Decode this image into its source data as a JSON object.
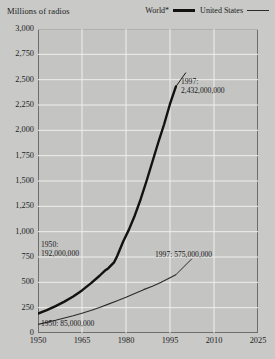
{
  "header": {
    "axis_title": "Millions of radios"
  },
  "legend": {
    "position": "top-right",
    "items": [
      {
        "label": "World*",
        "style": "thick-line",
        "color": "#14120f"
      },
      {
        "label": "United States",
        "style": "thin-line",
        "color": "#2b2b2b"
      }
    ]
  },
  "annotations": [
    {
      "id": "world-1997",
      "line1": "1997:",
      "line2": "2,432,000,000"
    },
    {
      "id": "world-1950",
      "line1": "1950:",
      "line2": "192,000,000"
    },
    {
      "id": "us-1997",
      "text": "1997:  575,000,000"
    },
    {
      "id": "us-1950",
      "text": "1950: 85,000,000"
    }
  ],
  "colors": {
    "background": "#c9c9c7",
    "plot_background": "#c4c4c2",
    "gridline": "#efefed",
    "border": "#6e6e6c",
    "world_line": "#14120f",
    "us_line": "#2b2b2b",
    "text": "#1c1c1c"
  },
  "chart_data": {
    "type": "line",
    "title": "",
    "subtitle": "",
    "xlabel": "",
    "ylabel": "Millions of radios",
    "xlim": [
      1950,
      2025
    ],
    "ylim": [
      0,
      3000
    ],
    "grid": true,
    "legend_position": "top-right",
    "footnote": "* asterisk on World series label",
    "yticks": [
      0,
      250,
      500,
      750,
      1000,
      1250,
      1500,
      1750,
      2000,
      2250,
      2500,
      2750,
      3000
    ],
    "ytick_labels": [
      "0",
      "250",
      "500",
      "750",
      "1,000",
      "1,250",
      "1,500",
      "1,750",
      "2,000",
      "2,250",
      "2,500",
      "2,750",
      "3,000"
    ],
    "xticks": [
      1950,
      1965,
      1980,
      1995,
      2010,
      2025
    ],
    "xtick_labels": [
      "1950",
      "1965",
      "1980",
      "1995",
      "2010",
      "2025"
    ],
    "series": [
      {
        "name": "World*",
        "color": "#14120f",
        "width": "thick",
        "x": [
          1950,
          1953,
          1956,
          1959,
          1962,
          1965,
          1968,
          1971,
          1973,
          1974,
          1976,
          1977,
          1979,
          1981,
          1983,
          1985,
          1987,
          1989,
          1991,
          1993,
          1995,
          1997
        ],
        "values": [
          192,
          225,
          265,
          310,
          360,
          420,
          490,
          565,
          620,
          640,
          700,
          760,
          900,
          1020,
          1160,
          1320,
          1500,
          1690,
          1880,
          2060,
          2260,
          2432
        ],
        "start_point": {
          "year": 1950,
          "value": 192,
          "label": "192,000,000"
        },
        "end_point": {
          "year": 1997,
          "value": 2432,
          "label": "2,432,000,000"
        }
      },
      {
        "name": "United States",
        "color": "#2b2b2b",
        "width": "thin",
        "x": [
          1950,
          1953,
          1956,
          1959,
          1962,
          1965,
          1968,
          1971,
          1974,
          1977,
          1980,
          1983,
          1986,
          1989,
          1992,
          1995,
          1997
        ],
        "values": [
          85,
          105,
          125,
          148,
          170,
          195,
          222,
          252,
          285,
          318,
          352,
          390,
          428,
          462,
          500,
          545,
          575
        ],
        "start_point": {
          "year": 1950,
          "value": 85,
          "label": "85,000,000"
        },
        "end_point": {
          "year": 1997,
          "value": 575,
          "label": "575,000,000"
        }
      }
    ]
  }
}
